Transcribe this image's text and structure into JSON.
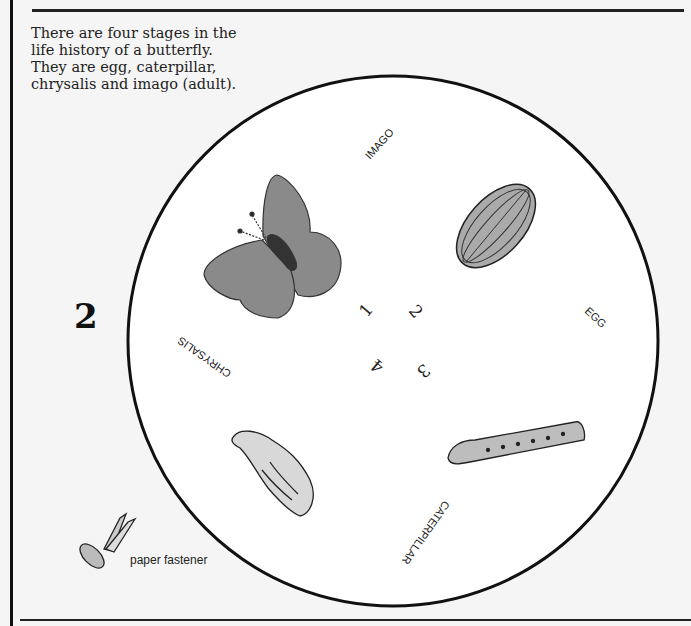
{
  "intro": {
    "lines": [
      "There are four stages in the",
      "life history of a butterfly.",
      "They are egg, caterpillar,",
      "chrysalis and imago (adult)."
    ]
  },
  "page_number": "2",
  "wheel": {
    "stage_labels": {
      "imago": "IMAGO",
      "egg": "EGG",
      "caterpillar": "CATERPILLAR",
      "chrysalis": "CHRYSALIS"
    },
    "center_numbers": [
      "1",
      "2",
      "3",
      "4"
    ]
  },
  "fastener": {
    "label": "paper fastener"
  },
  "colors": {
    "ink": "#111111",
    "paper": "#f5f5f5",
    "wheel_fill": "#ffffff",
    "wing_gray": "#8a8a8a"
  }
}
